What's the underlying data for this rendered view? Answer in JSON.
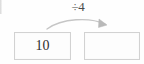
{
  "diagram": {
    "type": "arithmetic-operation-flow",
    "operator_label": "÷4",
    "arrow": {
      "icon": "curved-arrow-right-icon",
      "direction": "left-to-right",
      "color": "#c4c4c4"
    },
    "boxes": [
      {
        "name": "input-box",
        "value": "10",
        "empty": false
      },
      {
        "name": "answer-box",
        "value": "",
        "empty": true
      }
    ]
  }
}
